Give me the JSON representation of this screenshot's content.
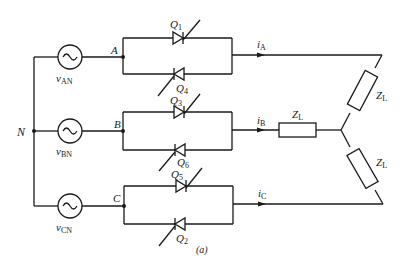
{
  "figure": {
    "caption": "(a)",
    "neutral_label": "N",
    "sources": [
      {
        "id": "vAN",
        "var": "v",
        "sub": "AN",
        "node": "A"
      },
      {
        "id": "vBN",
        "var": "v",
        "sub": "BN",
        "node": "B"
      },
      {
        "id": "vCN",
        "var": "v",
        "sub": "CN",
        "node": "C"
      }
    ],
    "nodes": [
      "A",
      "B",
      "C"
    ],
    "thyristors": [
      {
        "var": "Q",
        "sub": "1",
        "phase": "A",
        "direction": "forward"
      },
      {
        "var": "Q",
        "sub": "4",
        "phase": "A",
        "direction": "reverse"
      },
      {
        "var": "Q",
        "sub": "3",
        "phase": "B",
        "direction": "forward"
      },
      {
        "var": "Q",
        "sub": "6",
        "phase": "B",
        "direction": "reverse"
      },
      {
        "var": "Q",
        "sub": "5",
        "phase": "C",
        "direction": "forward"
      },
      {
        "var": "Q",
        "sub": "2",
        "phase": "C",
        "direction": "reverse"
      }
    ],
    "currents": [
      {
        "var": "i",
        "sub": "A"
      },
      {
        "var": "i",
        "sub": "B"
      },
      {
        "var": "i",
        "sub": "C"
      }
    ],
    "load": {
      "connection": "wye",
      "impedances": [
        {
          "var": "Z",
          "sub": "L",
          "branch": "A"
        },
        {
          "var": "Z",
          "sub": "L",
          "branch": "B"
        },
        {
          "var": "Z",
          "sub": "L",
          "branch": "C"
        }
      ]
    }
  }
}
